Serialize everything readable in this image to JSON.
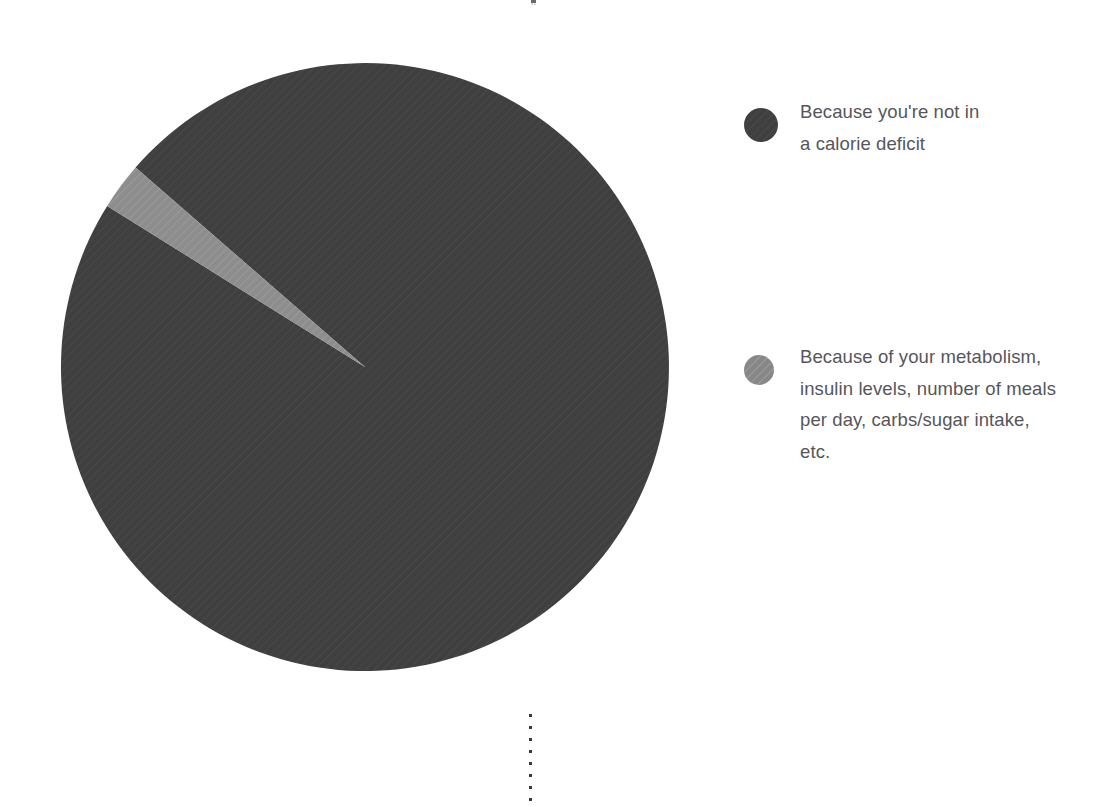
{
  "canvas": {
    "width": 1097,
    "height": 807,
    "background": "#ffffff"
  },
  "chart_data": {
    "type": "pie",
    "title": "",
    "subtitle": "",
    "xlabel": "",
    "ylabel": "",
    "legend_position": "right",
    "grid": false,
    "categories": [
      "Because you're not in a calorie deficit",
      "Because of your metabolism, insulin levels, number of meals per day, carbs/sugar intake, etc."
    ],
    "values": [
      97.5,
      2.5
    ],
    "units": "%",
    "colors": [
      "#403f3f",
      "#8d8d8d"
    ],
    "slices": [
      {
        "label": "Because you're not in a calorie deficit",
        "value": 97.5,
        "color": "#403f3f",
        "start_angle_deg": 311,
        "end_angle_deg": 662
      },
      {
        "label": "Because of your metabolism, insulin levels, number of meals per day, carbs/sugar intake, etc.",
        "value": 2.5,
        "color": "#8d8d8d",
        "start_angle_deg": 302,
        "end_angle_deg": 311
      }
    ],
    "geometry": {
      "center_x": 307,
      "center_y": 307,
      "radius": 304
    }
  },
  "legend": {
    "items": [
      {
        "swatch_name": "legend-swatch-calorie-deficit",
        "color": "#403f3f",
        "label": "Because you're not in\na calorie deficit"
      },
      {
        "swatch_name": "legend-swatch-metabolism",
        "color": "#8d8d8d",
        "label": "Because of your metabolism,\ninsulin levels, number of meals\nper day, carbs/sugar intake,\netc."
      }
    ]
  },
  "annotations": {
    "dotted_guide_color": "#3a3a3a",
    "top_tick_color": "#5a5a5a"
  }
}
